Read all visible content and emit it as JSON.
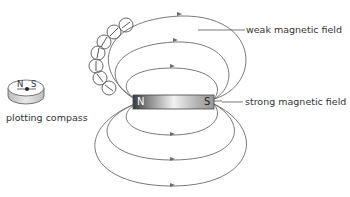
{
  "diagram": {
    "labels": {
      "weak": "weak magnetic field",
      "strong": "strong magnetic field",
      "compass": "plotting compass"
    },
    "magnet": {
      "north": "N",
      "south": "S"
    },
    "compass": {
      "north": "N",
      "south": "S"
    }
  }
}
